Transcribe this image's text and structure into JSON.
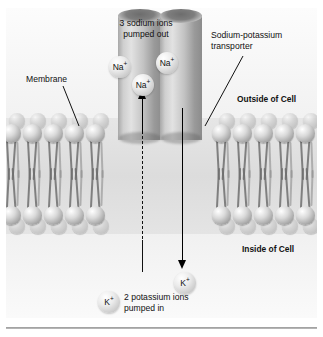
{
  "figure": {
    "title_alt": "Sodium-potassium pump across the cell membrane",
    "labels": {
      "sodium_callout": "3 sodium ions\npumped out",
      "transporter_callout": "Sodium-potassium\ntransporter",
      "membrane_callout": "Membrane",
      "outside_label": "Outside of Cell",
      "inside_label": "Inside of Cell",
      "potassium_callout": "2 potassium ions\npumped in"
    },
    "ions": {
      "sodium": [
        {
          "id": "na-1",
          "label": "Na",
          "charge": "+"
        },
        {
          "id": "na-2",
          "label": "Na",
          "charge": "+"
        },
        {
          "id": "na-3",
          "label": "Na",
          "charge": "+"
        }
      ],
      "potassium": [
        {
          "id": "k-1",
          "label": "K",
          "charge": "+"
        },
        {
          "id": "k-2",
          "label": "K",
          "charge": "+"
        }
      ]
    },
    "colors": {
      "background": "#ffffff",
      "panel": "#f4f4f4",
      "membrane": "#dcdcdc",
      "lipid_head": "#9e9e9e",
      "lipid_tail": "#6f6f6f",
      "transporter": "#c2c2c2",
      "ion": "#c8c8c8",
      "arrow": "#000000",
      "text": "#111111",
      "rule": "#9a9a9a"
    },
    "counts": {
      "sodium_out": 3,
      "potassium_in": 2,
      "direction_sodium": "out",
      "direction_potassium": "in"
    }
  }
}
